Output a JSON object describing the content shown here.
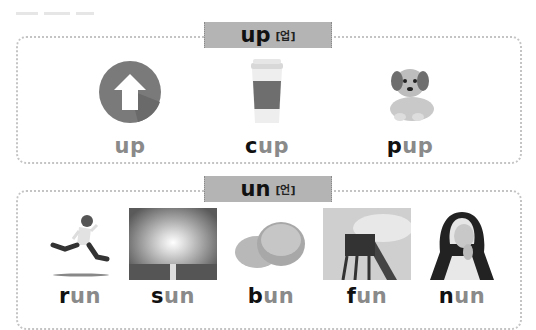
{
  "sections": [
    {
      "tag": {
        "word": "up",
        "korean": "[업]"
      },
      "items": [
        {
          "picture": "up-arrow-icon",
          "head": "",
          "rest": "up"
        },
        {
          "picture": "coffee-cup-image",
          "head": "c",
          "rest": "up"
        },
        {
          "picture": "puppy-image",
          "head": "p",
          "rest": "up"
        }
      ]
    },
    {
      "tag": {
        "word": "un",
        "korean": "[언]"
      },
      "items": [
        {
          "picture": "running-boy-image",
          "head": "r",
          "rest": "un"
        },
        {
          "picture": "sun-image",
          "head": "s",
          "rest": "un"
        },
        {
          "picture": "bun-image",
          "head": "b",
          "rest": "un"
        },
        {
          "picture": "roller-coaster-image",
          "head": "f",
          "rest": "un"
        },
        {
          "picture": "nun-image",
          "head": "n",
          "rest": "un"
        }
      ]
    }
  ],
  "colors": {
    "tag_bg": "#b4b4b4",
    "word_gray": "#8a8a8a",
    "word_dark": "#111111",
    "border": "#c4c4c4"
  }
}
